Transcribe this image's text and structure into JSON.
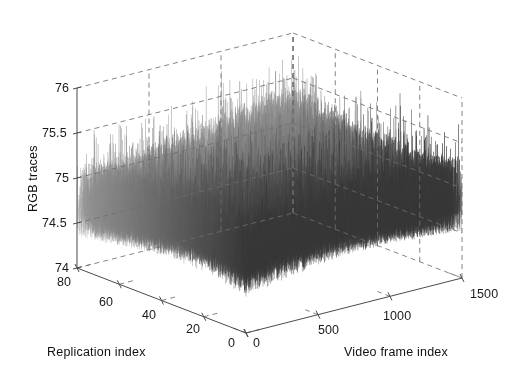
{
  "figure": {
    "type": "matlab-3d-mesh-figure",
    "background": "#ffffff",
    "line_color": "#4a4a4a",
    "grid_color": "#6e6e6e"
  },
  "chart_data": {
    "type": "line",
    "render": "3d-waterfall-mesh",
    "title": "",
    "subtitle": "",
    "xlabel": "Replication index",
    "ylabel": "Video frame index",
    "zlabel": "RGB traces",
    "grid": true,
    "legend": null,
    "projection": "3d-axonometric",
    "x_axis": {
      "label": "Replication index",
      "ticks": [
        80,
        60,
        40,
        20,
        0
      ],
      "tick_labels": [
        "80",
        "60",
        "40",
        "20",
        "0"
      ],
      "lim": [
        0,
        80
      ],
      "direction": "descending-left-to-right"
    },
    "y_axis": {
      "label": "Video frame index",
      "ticks": [
        0,
        500,
        1000,
        1500
      ],
      "tick_labels": [
        "0",
        "500",
        "1000",
        "1500"
      ],
      "lim": [
        0,
        1500
      ],
      "direction": "ascending-left-to-right"
    },
    "z_axis": {
      "label": "RGB traces",
      "ticks": [
        74,
        74.5,
        75,
        75.5,
        76
      ],
      "tick_labels": [
        "74",
        "74.5",
        "75",
        "75.5",
        "76"
      ],
      "lim": [
        74,
        76
      ]
    },
    "series_description": "Dense stack of ~80 noisy replication traces of RGB value versus video frame index; each trace oscillates rapidly around a mean near 74.9 with spikes reaching about 75.8",
    "n_series": 80,
    "n_points_per_series": 1500,
    "value_mean": 74.9,
    "value_min": 74.0,
    "value_max": 75.85,
    "noise_amplitude": 0.45,
    "series_color": "#555555"
  },
  "labels": {
    "z": [
      "76",
      "75.5",
      "75",
      "74.5",
      "74"
    ],
    "x": [
      "80",
      "60",
      "40",
      "20",
      "0"
    ],
    "y": [
      "0",
      "500",
      "1000",
      "1500"
    ],
    "x_title": "Replication index",
    "y_title": "Video frame index",
    "z_title": "RGB traces"
  }
}
